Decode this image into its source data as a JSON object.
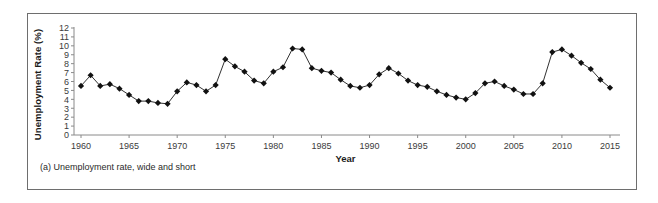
{
  "figure": {
    "caption": "(a) Unemployment rate, wide and short",
    "border_color": "#6e6e6e",
    "background": "#ffffff"
  },
  "chart_data": {
    "type": "line",
    "title": "",
    "subtitle": "",
    "xlabel": "Year",
    "ylabel": "Unemployment Rate (%)",
    "xlim": [
      1959.2,
      2016.2
    ],
    "ylim": [
      0,
      12
    ],
    "grid": false,
    "legend": null,
    "marker": "filled-diamond",
    "marker_color": "#111111",
    "line_color": "#1a1a1a",
    "x_ticks": [
      1960,
      1965,
      1970,
      1975,
      1980,
      1985,
      1990,
      1995,
      2000,
      2005,
      2010,
      2015
    ],
    "x_tick_labels": [
      "1960",
      "1965",
      "1970",
      "1975",
      "1980",
      "1985",
      "1990",
      "1995",
      "2000",
      "2005",
      "2010",
      "2015"
    ],
    "y_ticks": [
      0,
      1,
      2,
      3,
      4,
      5,
      6,
      7,
      8,
      9,
      10,
      11,
      12
    ],
    "y_tick_labels": [
      "0",
      "1",
      "2",
      "3",
      "4",
      "5",
      "6",
      "7",
      "8",
      "9",
      "10",
      "11",
      "12"
    ],
    "x": [
      1960,
      1961,
      1962,
      1963,
      1964,
      1965,
      1966,
      1967,
      1968,
      1969,
      1970,
      1971,
      1972,
      1973,
      1974,
      1975,
      1976,
      1977,
      1978,
      1979,
      1980,
      1981,
      1982,
      1983,
      1984,
      1985,
      1986,
      1987,
      1988,
      1989,
      1990,
      1991,
      1992,
      1993,
      1994,
      1995,
      1996,
      1997,
      1998,
      1999,
      2000,
      2001,
      2002,
      2003,
      2004,
      2005,
      2006,
      2007,
      2008,
      2009,
      2010,
      2011,
      2012,
      2013,
      2014,
      2015
    ],
    "values": [
      5.5,
      6.7,
      5.5,
      5.7,
      5.2,
      4.5,
      3.8,
      3.8,
      3.6,
      3.5,
      4.9,
      5.9,
      5.6,
      4.9,
      5.6,
      8.5,
      7.7,
      7.1,
      6.1,
      5.8,
      7.1,
      7.6,
      9.7,
      9.6,
      7.5,
      7.2,
      7.0,
      6.2,
      5.5,
      5.3,
      5.6,
      6.8,
      7.5,
      6.9,
      6.1,
      5.6,
      5.4,
      4.9,
      4.5,
      4.2,
      4.0,
      4.7,
      5.8,
      6.0,
      5.5,
      5.1,
      4.6,
      4.6,
      5.8,
      9.3,
      9.6,
      8.9,
      8.1,
      7.4,
      6.2,
      5.3
    ],
    "series": [
      {
        "name": "Unemployment Rate (%)",
        "values": [
          5.5,
          6.7,
          5.5,
          5.7,
          5.2,
          4.5,
          3.8,
          3.8,
          3.6,
          3.5,
          4.9,
          5.9,
          5.6,
          4.9,
          5.6,
          8.5,
          7.7,
          7.1,
          6.1,
          5.8,
          7.1,
          7.6,
          9.7,
          9.6,
          7.5,
          7.2,
          7.0,
          6.2,
          5.5,
          5.3,
          5.6,
          6.8,
          7.5,
          6.9,
          6.1,
          5.6,
          5.4,
          4.9,
          4.5,
          4.2,
          4.0,
          4.7,
          5.8,
          6.0,
          5.5,
          5.1,
          4.6,
          4.6,
          5.8,
          9.3,
          9.6,
          8.9,
          8.1,
          7.4,
          6.2,
          5.3
        ]
      }
    ]
  }
}
